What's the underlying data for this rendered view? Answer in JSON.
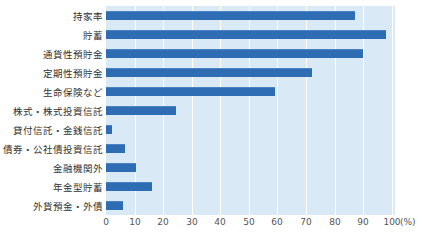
{
  "chart_data": {
    "type": "bar",
    "orientation": "horizontal",
    "title": "",
    "categories": [
      "持家率",
      "貯蓄",
      "通貨性預貯金",
      "定期性預貯金",
      "生命保険など",
      "株式・株式投資信託",
      "貸付信託・金銭信託",
      "債券・公社債投資信託",
      "金融機関外",
      "年金型貯蓄",
      "外貨預金・外債"
    ],
    "values": [
      87,
      98,
      90,
      72,
      59,
      24.5,
      2,
      6.5,
      10.5,
      16,
      6
    ],
    "x_ticks": [
      0,
      10,
      20,
      30,
      40,
      50,
      60,
      70,
      80,
      90,
      100
    ],
    "xlim": [
      0,
      100
    ],
    "unit_label": "(%)",
    "grid": true,
    "legend": "none",
    "colors": {
      "bar": "#2e6cb4",
      "bar_highlight": "#4a82c4",
      "plot_background": "#d9e9f5",
      "grid_line": "#ffffff",
      "label_text": "#333333",
      "tick_text": "#555555",
      "page_background": "#ffffff"
    }
  }
}
